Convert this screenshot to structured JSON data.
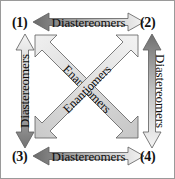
{
  "diagram": {
    "corners": [
      {
        "id": "1",
        "label": "(1)",
        "position": "top-left"
      },
      {
        "id": "2",
        "label": "(2)",
        "position": "top-right"
      },
      {
        "id": "3",
        "label": "(3)",
        "position": "bottom-left"
      },
      {
        "id": "4",
        "label": "(4)",
        "position": "bottom-right"
      }
    ],
    "relationships": [
      {
        "id": "top",
        "label": "Diastereomers",
        "from": "1",
        "to": "2",
        "orientation": "horizontal",
        "arrow": "double",
        "gradient": [
          "#6f6f6f",
          "#f2f2f2"
        ]
      },
      {
        "id": "bottom",
        "label": "Diastereomers",
        "from": "3",
        "to": "4",
        "orientation": "horizontal",
        "arrow": "double",
        "gradient": [
          "#6f6f6f",
          "#f2f2f2"
        ]
      },
      {
        "id": "left",
        "label": "Diastereomers",
        "from": "1",
        "to": "3",
        "orientation": "vertical",
        "arrow": "double",
        "gradient": [
          "#f2f2f2",
          "#6f6f6f"
        ]
      },
      {
        "id": "right",
        "label": "Diastereomers",
        "from": "2",
        "to": "4",
        "orientation": "vertical",
        "arrow": "double",
        "gradient": [
          "#6f6f6f",
          "#f2f2f2"
        ]
      },
      {
        "id": "diag-nw-se",
        "label": "Enantiomers",
        "from": "1",
        "to": "4",
        "orientation": "diagonal",
        "arrow": "double",
        "gradient": [
          "#ededed",
          "#cfcfcf"
        ]
      },
      {
        "id": "diag-sw-ne",
        "label": "Enantiomers",
        "from": "3",
        "to": "2",
        "orientation": "diagonal",
        "arrow": "double",
        "gradient": [
          "#cfcfcf",
          "#ededed"
        ]
      }
    ],
    "colors": {
      "outline": "#5d5d5d",
      "text": "#0d0d0d",
      "border": "#9a9a9a",
      "background": "#ffffff"
    }
  }
}
